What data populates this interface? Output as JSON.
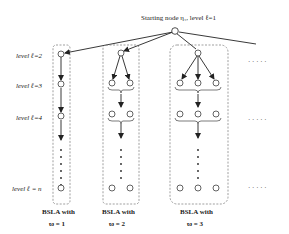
{
  "diagram": {
    "root_label": "Starting node η₁, level ℓ=1",
    "levels": [
      {
        "label": "level ℓ=2"
      },
      {
        "label": "level ℓ=3"
      },
      {
        "label": "level ℓ=4"
      },
      {
        "label": "level  ℓ = n"
      }
    ],
    "columns": [
      {
        "caption_line1": "BSLA with",
        "caption_line2": "ϖ = 1",
        "nodes_per_level": 1
      },
      {
        "caption_line1": "BSLA with",
        "caption_line2": "ϖ = 2",
        "nodes_per_level": 2
      },
      {
        "caption_line1": "BSLA with",
        "caption_line2": "ϖ = 3",
        "nodes_per_level": 3
      }
    ],
    "ellipsis": "· · · · ·",
    "colors": {
      "line": "#222222",
      "dashed_box": "#777777",
      "node_fill": "#ffffff"
    }
  }
}
